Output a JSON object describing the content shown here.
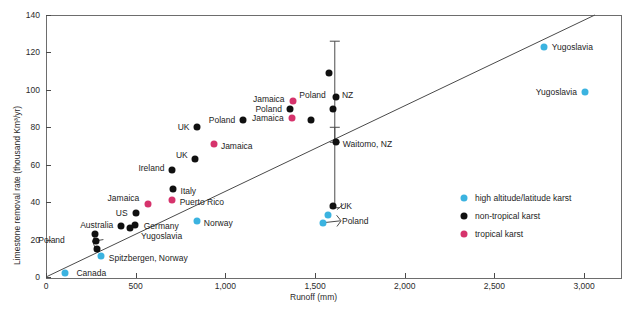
{
  "chart_data": {
    "type": "scatter",
    "title": "",
    "xlabel": "Runoff (mm)",
    "ylabel": "Limestone removal rate (thousand Km3/yr)",
    "ylabel_display": "Limestone removal rate (thousand Km³/yr)",
    "xlim": [
      0,
      3200
    ],
    "ylim": [
      0,
      140
    ],
    "xticks": [
      0,
      500,
      1000,
      1500,
      2000,
      2500,
      3000
    ],
    "xticklabels": [
      "0",
      "500",
      "1,000",
      "1,500",
      "2,000",
      "2,500",
      "3,000"
    ],
    "yticks": [
      0,
      20,
      40,
      60,
      80,
      100,
      120,
      140
    ],
    "yticklabels": [
      "0",
      "20",
      "40",
      "60",
      "80",
      "100",
      "120",
      "140"
    ],
    "grid": false,
    "legend_position": "inside-right",
    "trendline": {
      "x0": 0,
      "y0": 0,
      "x1": 3060,
      "y1": 140
    },
    "legend": [
      {
        "label": "high altitude/latitude karst",
        "color": "#3bb3e0",
        "key": "blue"
      },
      {
        "label": "non-tropical karst",
        "color": "#101010",
        "key": "black"
      },
      {
        "label": "tropical karst",
        "color": "#d6336c",
        "key": "pink"
      }
    ],
    "colors": {
      "blue": "#3bb3e0",
      "black": "#101010",
      "pink": "#d6336c",
      "axis": "#4a4a4a"
    },
    "errorbars": [
      {
        "x": 1610,
        "y": 96,
        "ymin": 72,
        "ymax": 126,
        "label": "NZ"
      },
      {
        "x": 1610,
        "y": 72,
        "ymin": 37,
        "ymax": 80,
        "label": "Waitomo, NZ"
      }
    ],
    "points": [
      {
        "label": "Canada",
        "series": "blue",
        "x": 105,
        "y": 2,
        "lx": 170,
        "ly": 2,
        "anchor": "l"
      },
      {
        "label": "Spitzbergen, Norway",
        "series": "blue",
        "x": 305,
        "y": 11,
        "lx": 350,
        "ly": 10,
        "anchor": "l"
      },
      {
        "label": "Poland",
        "series": "black",
        "x": 275,
        "y": 23,
        "lx": 105,
        "ly": 20,
        "anchor": "r"
      },
      {
        "label": "",
        "series": "black",
        "x": 280,
        "y": 19,
        "lx": null,
        "ly": null,
        "anchor": "l"
      },
      {
        "label": "",
        "series": "black",
        "x": 283,
        "y": 15,
        "lx": null,
        "ly": null,
        "anchor": "l"
      },
      {
        "label": "Australia",
        "series": "black",
        "x": 420,
        "y": 27,
        "lx": 375,
        "ly": 28,
        "anchor": "r"
      },
      {
        "label": "Yugoslavia",
        "series": "black",
        "x": 470,
        "y": 26,
        "lx": 530,
        "ly": 22,
        "anchor": "l"
      },
      {
        "label": "Germany",
        "series": "black",
        "x": 495,
        "y": 28,
        "lx": 545,
        "ly": 27,
        "anchor": "l"
      },
      {
        "label": "US",
        "series": "black",
        "x": 500,
        "y": 34,
        "lx": 455,
        "ly": 34,
        "anchor": "r"
      },
      {
        "label": "Jamaica",
        "series": "pink",
        "x": 570,
        "y": 39,
        "lx": 520,
        "ly": 42,
        "anchor": "r"
      },
      {
        "label": "Puerto Rico",
        "series": "pink",
        "x": 705,
        "y": 41,
        "lx": 745,
        "ly": 40,
        "anchor": "l"
      },
      {
        "label": "Norway",
        "series": "blue",
        "x": 840,
        "y": 30,
        "lx": 880,
        "ly": 29,
        "anchor": "l"
      },
      {
        "label": "Italy",
        "series": "black",
        "x": 710,
        "y": 47,
        "lx": 750,
        "ly": 46,
        "anchor": "l"
      },
      {
        "label": "Ireland",
        "series": "black",
        "x": 705,
        "y": 57,
        "lx": 660,
        "ly": 58,
        "anchor": "r"
      },
      {
        "label": "UK",
        "series": "black",
        "x": 830,
        "y": 63,
        "lx": 790,
        "ly": 65,
        "anchor": "r"
      },
      {
        "label": "Jamaica",
        "series": "pink",
        "x": 935,
        "y": 71,
        "lx": 975,
        "ly": 70,
        "anchor": "l"
      },
      {
        "label": "UK",
        "series": "black",
        "x": 840,
        "y": 80,
        "lx": 800,
        "ly": 80,
        "anchor": "r"
      },
      {
        "label": "Poland",
        "series": "black",
        "x": 1100,
        "y": 84,
        "lx": 1055,
        "ly": 84,
        "anchor": "r"
      },
      {
        "label": "Jamaica",
        "series": "pink",
        "x": 1370,
        "y": 85,
        "lx": 1325,
        "ly": 85,
        "anchor": "r"
      },
      {
        "label": "Poland",
        "series": "black",
        "x": 1360,
        "y": 90,
        "lx": 1315,
        "ly": 90,
        "anchor": "r"
      },
      {
        "label": "Jamaica",
        "series": "pink",
        "x": 1375,
        "y": 94,
        "lx": 1330,
        "ly": 95,
        "anchor": "r"
      },
      {
        "label": "Poland",
        "series": "black",
        "x": 1600,
        "y": 90,
        "lx": 1560,
        "ly": 97,
        "anchor": "r"
      },
      {
        "label": "",
        "series": "black",
        "x": 1480,
        "y": 84,
        "lx": null,
        "ly": null,
        "anchor": "l"
      },
      {
        "label": "",
        "series": "black",
        "x": 1575,
        "y": 109,
        "lx": null,
        "ly": null,
        "anchor": "l"
      },
      {
        "label": "NZ",
        "series": "black",
        "x": 1615,
        "y": 96,
        "lx": 1650,
        "ly": 97,
        "anchor": "l"
      },
      {
        "label": "Waitomo, NZ",
        "series": "black",
        "x": 1615,
        "y": 72,
        "lx": 1655,
        "ly": 71,
        "anchor": "l"
      },
      {
        "label": "UK",
        "series": "black",
        "x": 1600,
        "y": 38,
        "lx": 1640,
        "ly": 38,
        "anchor": "l"
      },
      {
        "label": "",
        "series": "blue",
        "x": 1570,
        "y": 33,
        "lx": null,
        "ly": null,
        "anchor": "l"
      },
      {
        "label": "Poland",
        "series": "blue",
        "x": 1545,
        "y": 29,
        "lx": 1650,
        "ly": 30,
        "anchor": "l"
      },
      {
        "label": "Yugoslavia",
        "series": "blue",
        "x": 2775,
        "y": 123,
        "lx": 2820,
        "ly": 123,
        "anchor": "l"
      },
      {
        "label": "Yugoslavia",
        "series": "blue",
        "x": 3005,
        "y": 99,
        "lx": 2960,
        "ly": 99,
        "anchor": "r"
      }
    ]
  }
}
